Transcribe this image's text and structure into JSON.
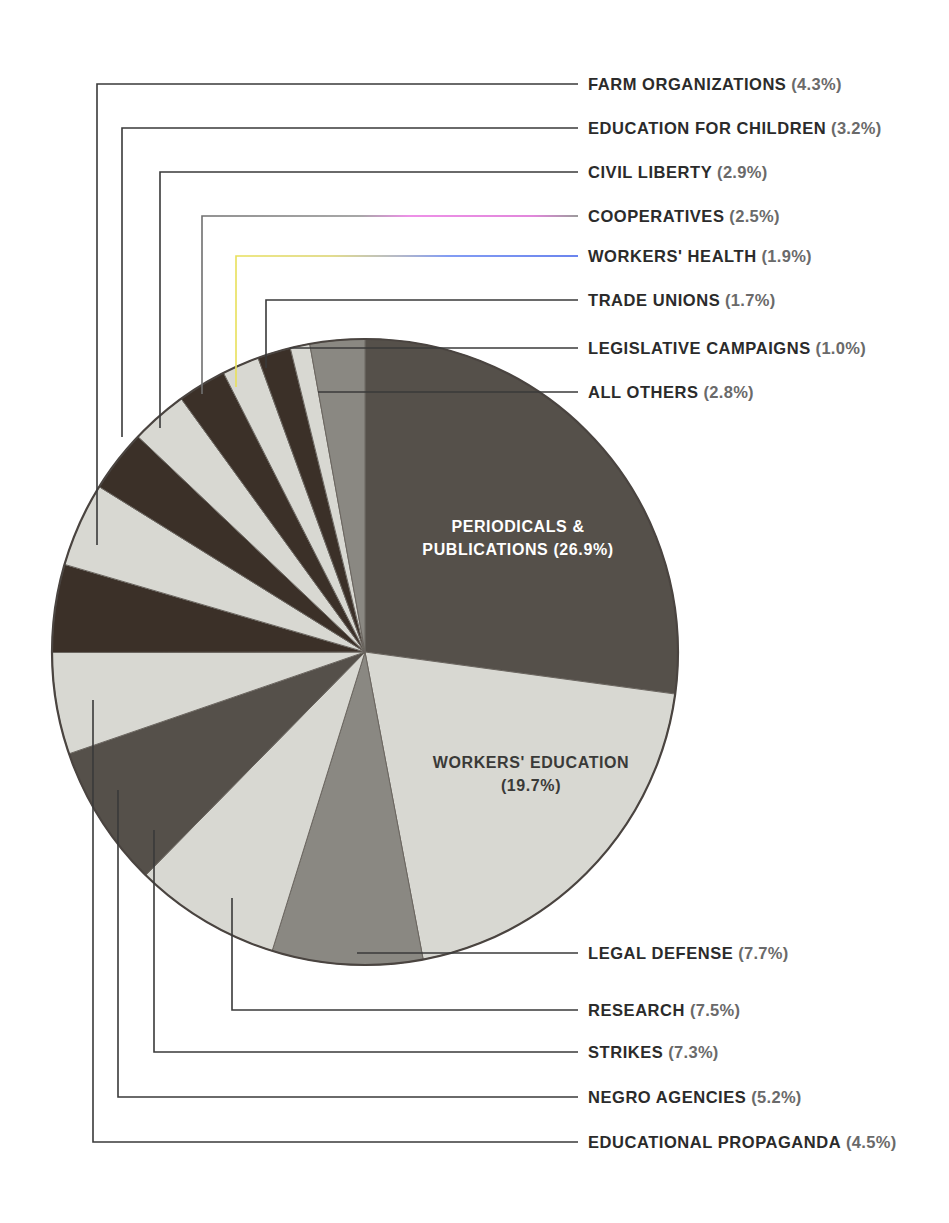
{
  "figure": {
    "background": "#ffffff",
    "pie": {
      "center_x": 365,
      "center_y": 652,
      "radius": 313,
      "outline_color": "#4a4440",
      "start_angle_deg": -90
    },
    "palette": {
      "dark": "#55504a",
      "darker": "#3b3028",
      "mid": "#8a8882",
      "light": "#d8d8d2",
      "lighter": "#e2e2dc",
      "leader_line": "#3a3a3a"
    }
  },
  "chart_data": {
    "type": "pie",
    "title": "",
    "units": "percent",
    "total": 100.1,
    "categories": [
      "PERIODICALS & PUBLICATIONS",
      "WORKERS' EDUCATION",
      "LEGAL DEFENSE",
      "RESEARCH",
      "STRIKES",
      "NEGRO AGENCIES",
      "EDUCATIONAL PROPAGANDA",
      "FARM ORGANIZATIONS",
      "EDUCATION FOR CHILDREN",
      "CIVIL LIBERTY",
      "COOPERATIVES",
      "WORKERS' HEALTH",
      "TRADE UNIONS",
      "LEGISLATIVE CAMPAIGNS",
      "ALL OTHERS"
    ],
    "values": [
      26.9,
      19.7,
      7.7,
      7.5,
      7.3,
      5.2,
      4.5,
      4.3,
      3.2,
      2.9,
      2.5,
      1.9,
      1.7,
      1.0,
      2.8
    ],
    "slice_colors": [
      "#55504a",
      "#d8d8d2",
      "#8a8882",
      "#d8d8d2",
      "#55504a",
      "#d8d8d2",
      "#3b3028",
      "#d8d8d2",
      "#3b3028",
      "#d8d8d2",
      "#3b3028",
      "#d8d8d2",
      "#3b3028",
      "#d8d8d2",
      "#8a8882"
    ],
    "legend_position": "leader-callouts"
  },
  "inner_labels": [
    {
      "id": "periodicals",
      "text": "PERIODICALS &\nPUBLICATIONS (26.9%)",
      "x": 518,
      "y": 539,
      "tone": "on-dark"
    },
    {
      "id": "workers-education",
      "text": "WORKERS' EDUCATION\n(19.7%)",
      "x": 531,
      "y": 775,
      "tone": "on-light"
    }
  ],
  "callouts": {
    "top": [
      {
        "id": "farm-organizations",
        "name": "FARM ORGANIZATIONS",
        "pct": "(4.3%)",
        "label_x": 588,
        "label_y": 84,
        "elbow_x": 97,
        "drop_y": 545,
        "tint": "none"
      },
      {
        "id": "education-children",
        "name": "EDUCATION FOR CHILDREN",
        "pct": "(3.2%)",
        "label_x": 588,
        "label_y": 128,
        "elbow_x": 122,
        "drop_y": 437,
        "tint": "none"
      },
      {
        "id": "civil-liberty",
        "name": "CIVIL LIBERTY",
        "pct": "(2.9%)",
        "label_x": 588,
        "label_y": 172,
        "elbow_x": 160,
        "drop_y": 428,
        "tint": "none"
      },
      {
        "id": "cooperatives",
        "name": "COOPERATIVES",
        "pct": "(2.5%)",
        "label_x": 588,
        "label_y": 216,
        "elbow_x": 202,
        "drop_y": 394,
        "tint": "magenta"
      },
      {
        "id": "workers-health",
        "name": "WORKERS' HEALTH",
        "pct": "(1.9%)",
        "label_x": 588,
        "label_y": 256,
        "elbow_x": 236,
        "drop_y": 387,
        "tint": "cyan"
      },
      {
        "id": "trade-unions",
        "name": "TRADE UNIONS",
        "pct": "(1.7%)",
        "label_x": 588,
        "label_y": 300,
        "elbow_x": 266,
        "drop_y": 368,
        "tint": "none"
      },
      {
        "id": "legislative-campaigns",
        "name": "LEGISLATIVE CAMPAIGNS",
        "pct": "(1.0%)",
        "label_x": 588,
        "label_y": 348,
        "elbow_x": 290,
        "drop_y": 348,
        "tint": "none"
      },
      {
        "id": "all-others",
        "name": "ALL OTHERS",
        "pct": "(2.8%)",
        "label_x": 588,
        "label_y": 392,
        "elbow_x": 318,
        "drop_y": 392,
        "tint": "none"
      }
    ],
    "bottom": [
      {
        "id": "legal-defense",
        "name": "LEGAL DEFENSE",
        "pct": "(7.7%)",
        "label_x": 588,
        "label_y": 953,
        "elbow_x": 357,
        "rise_y": 953,
        "tint": "none"
      },
      {
        "id": "research",
        "name": "RESEARCH",
        "pct": "(7.5%)",
        "label_x": 588,
        "label_y": 1010,
        "elbow_x": 232,
        "rise_y": 898,
        "tint": "none"
      },
      {
        "id": "strikes",
        "name": "STRIKES",
        "pct": "(7.3%)",
        "label_x": 588,
        "label_y": 1052,
        "elbow_x": 154,
        "rise_y": 830,
        "tint": "none"
      },
      {
        "id": "negro-agencies",
        "name": "NEGRO AGENCIES",
        "pct": "(5.2%)",
        "label_x": 588,
        "label_y": 1097,
        "elbow_x": 118,
        "rise_y": 790,
        "tint": "none"
      },
      {
        "id": "educational-propaganda",
        "name": "EDUCATIONAL PROPAGANDA",
        "pct": "(4.5%)",
        "label_x": 588,
        "label_y": 1142,
        "elbow_x": 93,
        "rise_y": 700,
        "tint": "none"
      }
    ],
    "line_end_x": 578
  }
}
